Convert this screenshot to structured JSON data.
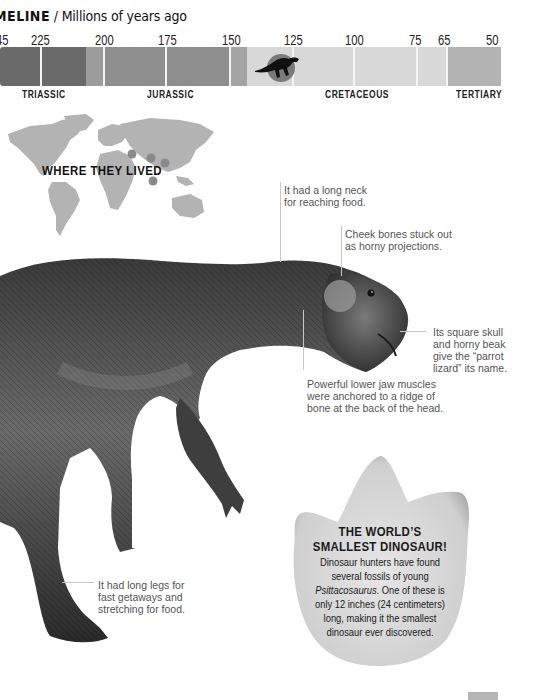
{
  "timeline": {
    "title_bold": "MELINE",
    "title_sub": " / Millions of years ago",
    "ticks": [
      {
        "label": "45",
        "x": -4
      },
      {
        "label": "225",
        "x": 31
      },
      {
        "label": "200",
        "x": 95
      },
      {
        "label": "175",
        "x": 158
      },
      {
        "label": "150",
        "x": 222
      },
      {
        "label": "125",
        "x": 284
      },
      {
        "label": "100",
        "x": 345
      },
      {
        "label": "75",
        "x": 409
      },
      {
        "label": "65",
        "x": 438
      },
      {
        "label": "50",
        "x": 486
      }
    ],
    "periods": [
      {
        "label": "TRIASSIC",
        "x": 22
      },
      {
        "label": "JURASSIC",
        "x": 147
      },
      {
        "label": "CRETACEOUS",
        "x": 325
      },
      {
        "label": "TERTIARY",
        "x": 456
      }
    ],
    "colors": {
      "triassic": "#6a6a6a",
      "early_jurassic": "#9a9a9a",
      "jurassic": "#8e8e8e",
      "late_jurassic": "#a6a6a6",
      "cretaceous": "#d9d9d9",
      "tertiary": "#b4b4b4",
      "marker_circle": "#7a7a7a",
      "marker_silhouette": "#111111"
    }
  },
  "map": {
    "title": "WHERE THEY LIVED",
    "land_color": "#b3b3b3",
    "dot_color": "#8a8a8a"
  },
  "callouts": {
    "neck": "It had a long neck\nfor reaching food.",
    "cheek": "Cheek bones stuck out\nas horny projections.",
    "skull": "Its square skull\nand horny beak\ngive the “parrot\nlizard” its name.",
    "jaw": "Powerful lower jaw muscles\nwere anchored to a ridge of\nbone at the back of the head.",
    "legs": "It had long legs for\nfast getaways and\nstretching for food."
  },
  "footprint": {
    "title_line1": "THE WORLD’S",
    "title_line2": "SMALLEST DINOSAUR!",
    "body_before": "Dinosaur hunters have found several fossils of young ",
    "body_italic": "Psittacosaurus",
    "body_after": ". One of these is only 12 inches (24 centimeters) long, making it the smallest dinosaur ever discovered."
  }
}
